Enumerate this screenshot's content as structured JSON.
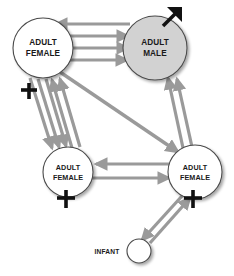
{
  "figure": {
    "type": "social-interaction-network-diagram",
    "background_color": "#ffffff",
    "edge_color": "#9a9a9a",
    "edge_color_dark": "#8a8a8a",
    "node_outline_color": "#4a4a4a",
    "node_fill_female": "#ffffff",
    "node_fill_male": "#d2d2d2",
    "node_fill_infant": "#ffffff",
    "label_color": "#1a1a1a",
    "symbol_color": "#111111"
  },
  "nodes": [
    {
      "id": "female-top-left",
      "label_line1": "ADULT",
      "label_line2": "FEMALE",
      "sex_symbol": "female-venus-symbol",
      "cx": 43,
      "cy": 48,
      "r": 30,
      "fill": "#ffffff",
      "class": "node-label-lg"
    },
    {
      "id": "male-top-right",
      "label_line1": "ADULT",
      "label_line2": "MALE",
      "sex_symbol": "male-mars-symbol",
      "cx": 155,
      "cy": 48,
      "r": 32,
      "fill": "#d2d2d2",
      "class": "node-label-lg"
    },
    {
      "id": "female-bottom-left",
      "label_line1": "ADULT",
      "label_line2": "FEMALE",
      "sex_symbol": "female-venus-symbol",
      "cx": 68,
      "cy": 172,
      "r": 25,
      "fill": "#ffffff",
      "class": "node-label-md"
    },
    {
      "id": "female-bottom-right",
      "label_line1": "ADULT",
      "label_line2": "FEMALE",
      "sex_symbol": "female-venus-symbol",
      "cx": 195,
      "cy": 172,
      "r": 27,
      "fill": "#ffffff",
      "class": "node-label-md"
    },
    {
      "id": "infant-bottom",
      "label_line1": "INFANT",
      "label_line2": "",
      "sex_symbol": "none",
      "cx": 139,
      "cy": 251,
      "r": 12,
      "fill": "#ffffff",
      "class": "node-label-sm"
    }
  ],
  "labels": {
    "adult_female": "ADULT FEMALE",
    "adult_male": "ADULT MALE",
    "infant": "INFANT",
    "adult": "ADULT",
    "female": "FEMALE",
    "male": "MALE"
  },
  "edges": [
    {
      "from": "male-top-right",
      "to": "female-top-left",
      "count": 1,
      "direction": "left"
    },
    {
      "from": "female-top-left",
      "to": "male-top-right",
      "count": 3,
      "direction": "right"
    },
    {
      "from": "female-top-left",
      "to": "female-bottom-left",
      "count": 3,
      "direction": "down"
    },
    {
      "from": "female-bottom-left",
      "to": "female-top-left",
      "count": 2,
      "direction": "up"
    },
    {
      "from": "female-top-left",
      "to": "female-bottom-right",
      "count": 1,
      "direction": "diagonal-down-right"
    },
    {
      "from": "female-bottom-right",
      "to": "male-top-right",
      "count": 2,
      "direction": "up"
    },
    {
      "from": "female-bottom-right",
      "to": "female-bottom-left",
      "count": 1,
      "direction": "left"
    },
    {
      "from": "female-bottom-left",
      "to": "female-bottom-right",
      "count": 1,
      "direction": "right"
    },
    {
      "from": "female-bottom-right",
      "to": "infant-bottom",
      "count": 1,
      "direction": "down-left"
    },
    {
      "from": "infant-bottom",
      "to": "female-bottom-right",
      "count": 1,
      "direction": "up-right"
    }
  ]
}
